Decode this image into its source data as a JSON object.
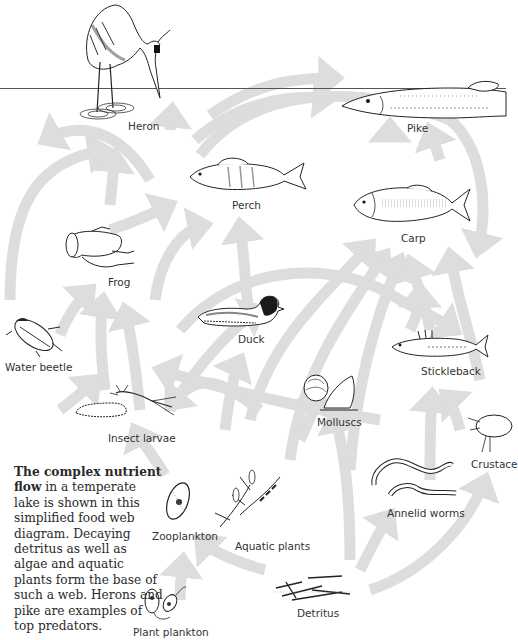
{
  "diagram": {
    "colors": {
      "arrow": "#dcdcdc",
      "waterline": "#555555",
      "ink": "#222222",
      "text": "#333333"
    },
    "organisms": [
      {
        "id": "heron",
        "label": "Heron",
        "level": "top predator"
      },
      {
        "id": "pike",
        "label": "Pike",
        "level": "top predator"
      },
      {
        "id": "perch",
        "label": "Perch"
      },
      {
        "id": "carp",
        "label": "Carp"
      },
      {
        "id": "frog",
        "label": "Frog"
      },
      {
        "id": "duck",
        "label": "Duck"
      },
      {
        "id": "water_beetle",
        "label": "Water beetle"
      },
      {
        "id": "stickleback",
        "label": "Stickleback"
      },
      {
        "id": "insect_larvae",
        "label": "Insect larvae"
      },
      {
        "id": "molluscs",
        "label": "Molluscs"
      },
      {
        "id": "crustaceans",
        "label": "Crustaceans"
      },
      {
        "id": "annelid_worms",
        "label": "Annelid worms"
      },
      {
        "id": "zooplankton",
        "label": "Zooplankton"
      },
      {
        "id": "aquatic_plants",
        "label": "Aquatic plants"
      },
      {
        "id": "detritus",
        "label": "Detritus",
        "level": "base"
      },
      {
        "id": "plant_plankton",
        "label": "Plant plankton",
        "level": "base"
      }
    ],
    "caption": {
      "bold": "The complex nutrient flow",
      "rest": " in a temperate lake is shown in this simplified food web diagram. Decaying detritus as well as algae and aquatic plants form the base of such a web. Herons and pike are examples of top predators."
    },
    "labels": {
      "heron": "Heron",
      "pike": "Pike",
      "perch": "Perch",
      "carp": "Carp",
      "frog": "Frog",
      "duck": "Duck",
      "water_beetle": "Water beetle",
      "stickleback": "Stickleback",
      "insect_larvae": "Insect larvae",
      "molluscs": "Molluscs",
      "crustaceans": "Crustace",
      "annelid_worms": "Annelid worms",
      "zooplankton": "Zooplankton",
      "aquatic_plants": "Aquatic plants",
      "detritus": "Detritus",
      "plant_plankton": "Plant plankton"
    }
  }
}
